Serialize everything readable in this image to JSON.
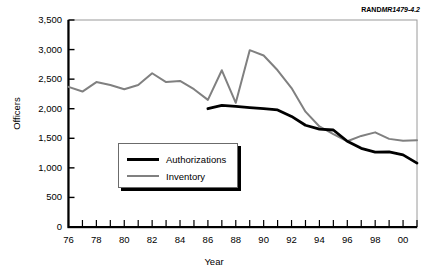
{
  "credit": {
    "brand": "RAND",
    "reference": "MR1479-4.2"
  },
  "axis_titles": {
    "x": "Year",
    "y": "Officers"
  },
  "legend": {
    "items": [
      {
        "label": "Authorizations",
        "color": "#000000"
      },
      {
        "label": "Inventory",
        "color": "#808080"
      }
    ]
  },
  "chart_data": {
    "type": "line",
    "title": "",
    "xlabel": "Year",
    "ylabel": "Officers",
    "xlim": [
      1976,
      2001
    ],
    "ylim": [
      0,
      3500
    ],
    "yticks": [
      0,
      500,
      1000,
      1500,
      2000,
      2500,
      3000,
      3500
    ],
    "ytick_labels": [
      "0",
      "500",
      "1,000",
      "1,500",
      "2,000",
      "2,500",
      "3,000",
      "3,500"
    ],
    "xticks": [
      1976,
      1977,
      1978,
      1979,
      1980,
      1981,
      1982,
      1983,
      1984,
      1985,
      1986,
      1987,
      1988,
      1989,
      1990,
      1991,
      1992,
      1993,
      1994,
      1995,
      1996,
      1997,
      1998,
      1999,
      2000,
      2001
    ],
    "xtick_labels": [
      "76",
      "",
      "78",
      "",
      "80",
      "",
      "82",
      "",
      "84",
      "",
      "86",
      "",
      "88",
      "",
      "90",
      "",
      "92",
      "",
      "94",
      "",
      "96",
      "",
      "98",
      "",
      "00",
      ""
    ],
    "grid": false,
    "legend_position": "inside-lower-left",
    "series": [
      {
        "name": "Authorizations",
        "color": "#000000",
        "x": [
          1986,
          1987,
          1988,
          1989,
          1990,
          1991,
          1992,
          1993,
          1994,
          1995,
          1996,
          1997,
          1998,
          1999,
          2000,
          2001
        ],
        "values": [
          2000,
          2055,
          2040,
          2020,
          2000,
          1980,
          1870,
          1720,
          1655,
          1640,
          1450,
          1330,
          1265,
          1270,
          1220,
          1080
        ]
      },
      {
        "name": "Inventory",
        "color": "#808080",
        "x": [
          1976,
          1977,
          1978,
          1979,
          1980,
          1981,
          1982,
          1983,
          1984,
          1985,
          1986,
          1987,
          1988,
          1989,
          1990,
          1991,
          1992,
          1993,
          1994,
          1995,
          1996,
          1997,
          1998,
          1999,
          2000,
          2001
        ],
        "values": [
          2370,
          2290,
          2450,
          2400,
          2330,
          2400,
          2600,
          2450,
          2470,
          2330,
          2150,
          2650,
          2100,
          2990,
          2900,
          2650,
          2350,
          1950,
          1700,
          1570,
          1450,
          1540,
          1600,
          1490,
          1460,
          1465
        ]
      }
    ]
  }
}
